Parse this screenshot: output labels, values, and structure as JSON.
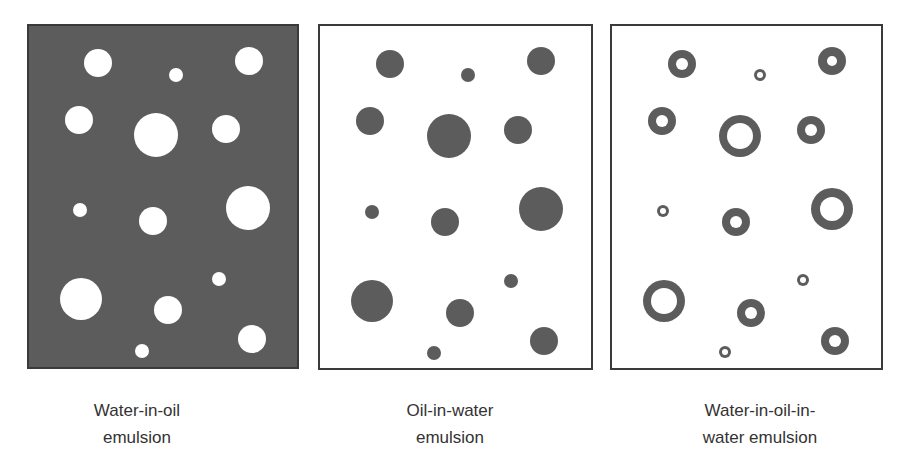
{
  "colors": {
    "oil_phase": "#5c5c5c",
    "water_phase": "#ffffff",
    "border": "#3a3a3a",
    "droplet_dark": "#5c5c5c",
    "text": "#333333"
  },
  "panels": [
    {
      "id": "water-in-oil",
      "caption_line1": "Water-in-oil",
      "caption_line2": "emulsion",
      "background": "#5c5c5c",
      "origin": [
        27,
        24
      ],
      "droplets": [
        {
          "cx": 98,
          "cy": 63,
          "r": 14
        },
        {
          "cx": 176,
          "cy": 75,
          "r": 7
        },
        {
          "cx": 249,
          "cy": 61,
          "r": 14
        },
        {
          "cx": 79,
          "cy": 120,
          "r": 14
        },
        {
          "cx": 156,
          "cy": 135,
          "r": 22
        },
        {
          "cx": 226,
          "cy": 129,
          "r": 14
        },
        {
          "cx": 80,
          "cy": 210,
          "r": 7
        },
        {
          "cx": 153,
          "cy": 221,
          "r": 14
        },
        {
          "cx": 248,
          "cy": 208,
          "r": 22
        },
        {
          "cx": 219,
          "cy": 279,
          "r": 7
        },
        {
          "cx": 81,
          "cy": 299,
          "r": 21
        },
        {
          "cx": 168,
          "cy": 310,
          "r": 14
        },
        {
          "cx": 252,
          "cy": 339,
          "r": 14
        },
        {
          "cx": 142,
          "cy": 351,
          "r": 7
        }
      ]
    },
    {
      "id": "oil-in-water",
      "caption_line1": "Oil-in-water",
      "caption_line2": "emulsion",
      "background": "#ffffff",
      "origin": [
        318,
        24
      ],
      "droplets": [
        {
          "cx": 390,
          "cy": 64,
          "r": 14
        },
        {
          "cx": 468,
          "cy": 75,
          "r": 7
        },
        {
          "cx": 541,
          "cy": 61,
          "r": 14
        },
        {
          "cx": 370,
          "cy": 121,
          "r": 14
        },
        {
          "cx": 449,
          "cy": 136,
          "r": 22
        },
        {
          "cx": 518,
          "cy": 130,
          "r": 14
        },
        {
          "cx": 372,
          "cy": 212,
          "r": 7
        },
        {
          "cx": 445,
          "cy": 222,
          "r": 14
        },
        {
          "cx": 541,
          "cy": 209,
          "r": 22
        },
        {
          "cx": 511,
          "cy": 281,
          "r": 7
        },
        {
          "cx": 372,
          "cy": 301,
          "r": 21
        },
        {
          "cx": 460,
          "cy": 313,
          "r": 14
        },
        {
          "cx": 544,
          "cy": 341,
          "r": 14
        },
        {
          "cx": 434,
          "cy": 353,
          "r": 7
        }
      ]
    },
    {
      "id": "water-in-oil-in-water",
      "caption_line1": "Water-in-oil-in-",
      "caption_line2": "water emulsion",
      "background": "#ffffff",
      "origin": [
        610,
        24
      ],
      "droplets": [
        {
          "cx": 682,
          "cy": 64,
          "r": 14,
          "inner": 6
        },
        {
          "cx": 760,
          "cy": 75,
          "r": 6,
          "inner": 3
        },
        {
          "cx": 832,
          "cy": 61,
          "r": 14,
          "inner": 5
        },
        {
          "cx": 662,
          "cy": 121,
          "r": 14,
          "inner": 6
        },
        {
          "cx": 740,
          "cy": 136,
          "r": 21,
          "inner": 13
        },
        {
          "cx": 811,
          "cy": 130,
          "r": 14,
          "inner": 6
        },
        {
          "cx": 663,
          "cy": 211,
          "r": 6,
          "inner": 3
        },
        {
          "cx": 736,
          "cy": 222,
          "r": 14,
          "inner": 6
        },
        {
          "cx": 832,
          "cy": 209,
          "r": 21,
          "inner": 12
        },
        {
          "cx": 803,
          "cy": 280,
          "r": 6,
          "inner": 3
        },
        {
          "cx": 664,
          "cy": 301,
          "r": 21,
          "inner": 13
        },
        {
          "cx": 751,
          "cy": 313,
          "r": 14,
          "inner": 6
        },
        {
          "cx": 835,
          "cy": 341,
          "r": 14,
          "inner": 6
        },
        {
          "cx": 725,
          "cy": 352,
          "r": 6,
          "inner": 3
        }
      ]
    }
  ]
}
